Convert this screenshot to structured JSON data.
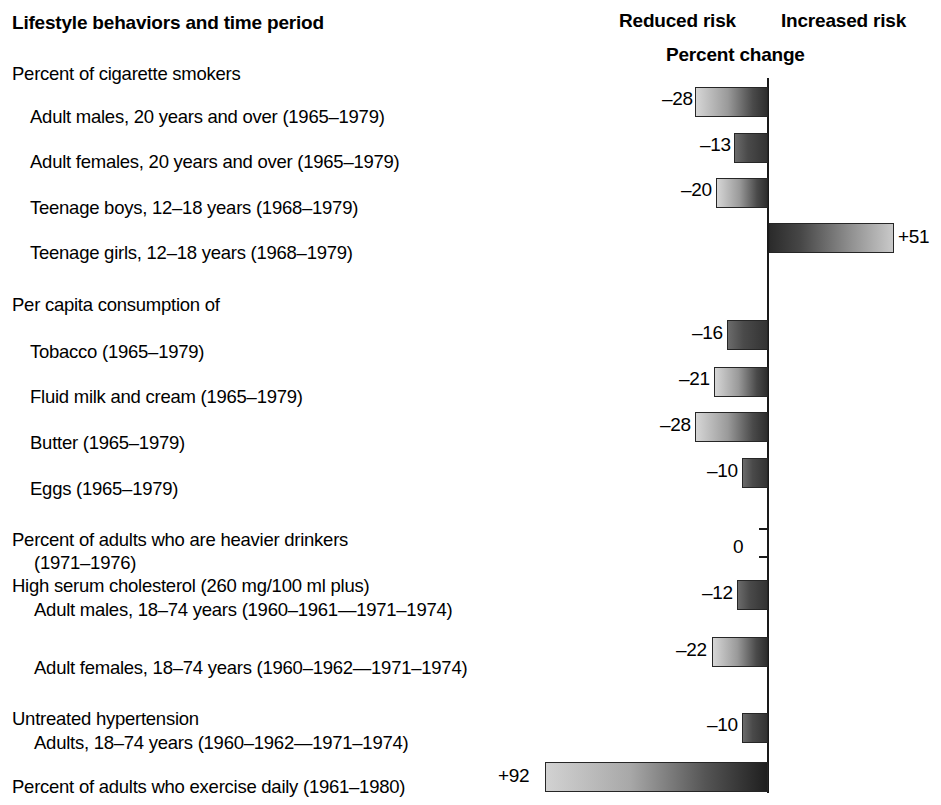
{
  "header": {
    "column_title": "Lifestyle behaviors and time period",
    "reduced_risk": "Reduced risk",
    "increased_risk": "Increased risk",
    "percent_change": "Percent change"
  },
  "chart_data": {
    "type": "bar",
    "title": "Percent change",
    "xlabel": "Percent change",
    "ylabel": "Lifestyle behaviors and time period",
    "orientation": "horizontal",
    "grid": false,
    "legend": [
      "Reduced risk",
      "Increased risk"
    ],
    "legend_position": "top",
    "axis_note": "Zero axis is vertical; negative (reduced risk) extends left, positive (increased risk) extends right",
    "xlim": [
      -30,
      95
    ],
    "categories": [
      "Adult males, 20 years and over (1965–1979)",
      "Adult females, 20 years and over (1965–1979)",
      "Teenage boys, 12–18 years (1968–1979)",
      "Teenage girls, 12–18 years (1968–1979)",
      "Tobacco (1965–1979)",
      "Fluid milk and cream (1965–1979)",
      "Butter (1965–1979)",
      "Eggs (1965–1979)",
      "Percent of adults who are heavier drinkers (1971–1976)",
      "Adult males, 18–74 years (1960–1961—1971–1974)",
      "Adult females, 18–74 years (1960–1962—1971–1974)",
      "Adults, 18–74 years (1960–1962—1971–1974)",
      "Percent of adults who exercise daily (1961–1980)"
    ],
    "values": [
      -28,
      -13,
      -20,
      51,
      -16,
      -21,
      -28,
      -10,
      0,
      -12,
      -22,
      -10,
      92
    ],
    "value_labels": [
      "–28",
      "–13",
      "–20",
      "+51",
      "–16",
      "–21",
      "–28",
      "–10",
      "0",
      "–12",
      "–22",
      "–10",
      "+92"
    ]
  },
  "rows": [
    {
      "label": "Percent of cigarette smokers",
      "indent": 0,
      "top": 62,
      "has_bar": false
    },
    {
      "label": "Adult males, 20 years and over (1965–1979)",
      "indent": 1,
      "top": 105,
      "has_bar": true,
      "value": -28,
      "value_label": "–28",
      "bar_top": 87,
      "bar_left": 695,
      "bar_width": 73,
      "style": "neg",
      "label_left": 662,
      "label_top": 88
    },
    {
      "label": "Adult females, 20 years and over (1965–1979)",
      "indent": 1,
      "top": 150,
      "has_bar": true,
      "value": -13,
      "value_label": "–13",
      "bar_top": 133,
      "bar_left": 734,
      "bar_width": 34,
      "style": "neg short",
      "label_left": 700,
      "label_top": 134
    },
    {
      "label": "Teenage boys, 12–18 years (1968–1979)",
      "indent": 1,
      "top": 196,
      "has_bar": true,
      "value": -20,
      "value_label": "–20",
      "bar_top": 178,
      "bar_left": 716,
      "bar_width": 52,
      "style": "neg",
      "label_left": 681,
      "label_top": 179
    },
    {
      "label": "Teenage girls, 12–18 years (1968–1979)",
      "indent": 1,
      "top": 241,
      "has_bar": true,
      "value": 51,
      "value_label": "+51",
      "bar_top": 223,
      "bar_left": 769,
      "bar_width": 125,
      "style": "pos",
      "label_left": 898,
      "label_top": 226
    },
    {
      "label": "Per capita consumption of",
      "indent": 0,
      "top": 293,
      "has_bar": false
    },
    {
      "label": "Tobacco (1965–1979)",
      "indent": 1,
      "top": 340,
      "has_bar": true,
      "value": -16,
      "value_label": "–16",
      "bar_top": 320,
      "bar_left": 727,
      "bar_width": 41,
      "style": "neg short",
      "label_left": 692,
      "label_top": 322
    },
    {
      "label": "Fluid milk and cream (1965–1979)",
      "indent": 1,
      "top": 385,
      "has_bar": true,
      "value": -21,
      "value_label": "–21",
      "bar_top": 367,
      "bar_left": 714,
      "bar_width": 54,
      "style": "neg",
      "label_left": 679,
      "label_top": 368
    },
    {
      "label": "Butter (1965–1979)",
      "indent": 1,
      "top": 431,
      "has_bar": true,
      "value": -28,
      "value_label": "–28",
      "bar_top": 412,
      "bar_left": 695,
      "bar_width": 73,
      "style": "neg",
      "label_left": 660,
      "label_top": 414
    },
    {
      "label": "Eggs (1965–1979)",
      "indent": 1,
      "top": 477,
      "has_bar": true,
      "value": -10,
      "value_label": "–10",
      "bar_top": 458,
      "bar_left": 742,
      "bar_width": 26,
      "style": "neg short",
      "label_left": 707,
      "label_top": 460
    },
    {
      "label": "Percent of adults who are heavier drinkers",
      "indent": 0,
      "top": 528,
      "has_bar": false
    },
    {
      "label": "(1971–1976)",
      "indent": 2,
      "top": 551,
      "has_bar": true,
      "value": 0,
      "value_label": "0",
      "bar_top": 528,
      "bar_left": 768,
      "bar_width": 0,
      "style": "zero",
      "label_left": 733,
      "label_top": 536
    },
    {
      "label": "High serum cholesterol (260 mg/100 ml plus)",
      "indent": 0,
      "top": 574,
      "has_bar": false
    },
    {
      "label": "Adult males, 18–74 years (1960–1961—1971–1974)",
      "indent": 2,
      "top": 598,
      "has_bar": true,
      "value": -12,
      "value_label": "–12",
      "bar_top": 580,
      "bar_left": 737,
      "bar_width": 31,
      "style": "neg short",
      "label_left": 702,
      "label_top": 582
    },
    {
      "label": "Adult females, 18–74 years (1960–1962—1971–1974)",
      "indent": 2,
      "top": 656,
      "has_bar": true,
      "value": -22,
      "value_label": "–22",
      "bar_top": 637,
      "bar_left": 712,
      "bar_width": 56,
      "style": "neg",
      "label_left": 676,
      "label_top": 639
    },
    {
      "label": "Untreated hypertension",
      "indent": 0,
      "top": 707,
      "has_bar": false
    },
    {
      "label": "Adults, 18–74 years (1960–1962—1971–1974)",
      "indent": 2,
      "top": 731,
      "has_bar": true,
      "value": -10,
      "value_label": "–10",
      "bar_top": 713,
      "bar_left": 742,
      "bar_width": 26,
      "style": "neg short",
      "label_left": 707,
      "label_top": 714
    },
    {
      "label": "Percent of adults who exercise daily (1961–1980)",
      "indent": 0,
      "top": 775,
      "has_bar": true,
      "value": 92,
      "value_label": "+92",
      "bar_top": 762,
      "bar_left": 545,
      "bar_width": 223,
      "style": "pos-left",
      "label_left": 498,
      "label_top": 765
    }
  ]
}
